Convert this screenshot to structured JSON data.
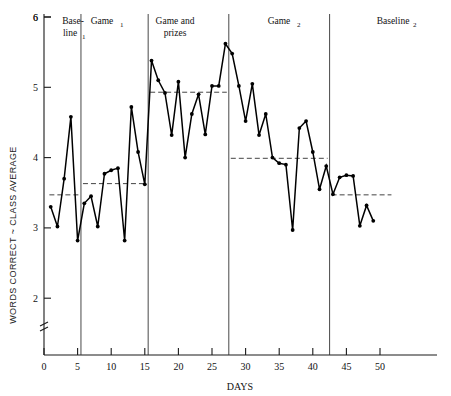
{
  "chart_data": {
    "type": "line",
    "title": "",
    "xlabel": "DAYS",
    "ylabel": "WORDS CORRECT ~ CLASS AVERAGE",
    "xlim": [
      0,
      52
    ],
    "ylim": [
      1.55,
      6
    ],
    "axis_break": true,
    "grid": false,
    "legend": "none",
    "xticks": [
      0,
      5,
      10,
      15,
      20,
      25,
      30,
      35,
      40,
      45,
      50
    ],
    "yticks": [
      2,
      3,
      4,
      5,
      6
    ],
    "series": [
      {
        "name": "Words correct minus class average",
        "x": [
          1,
          2,
          3,
          4,
          5,
          6,
          7,
          8,
          9,
          10,
          11,
          12,
          13,
          14,
          15,
          16,
          17,
          18,
          19,
          20,
          21,
          22,
          23,
          24,
          25,
          26,
          27,
          28,
          29,
          30,
          31,
          32,
          33,
          34,
          35,
          36,
          37,
          38,
          39,
          40,
          41,
          42,
          43,
          44,
          45,
          46,
          47,
          48,
          49
        ],
        "y": [
          3.3,
          3.02,
          3.7,
          4.58,
          2.82,
          3.35,
          3.45,
          3.02,
          3.77,
          3.82,
          3.85,
          2.82,
          4.72,
          4.08,
          3.62,
          5.38,
          5.1,
          4.92,
          4.32,
          5.08,
          4.0,
          4.62,
          4.9,
          4.33,
          5.02,
          5.02,
          5.62,
          5.48,
          5.02,
          4.52,
          5.05,
          4.32,
          4.62,
          4.0,
          3.92,
          3.9,
          2.97,
          4.42,
          4.52,
          4.08,
          3.55,
          3.88,
          3.48,
          3.72,
          3.75,
          3.74,
          3.03,
          3.32,
          3.1
        ]
      }
    ],
    "phases": [
      {
        "label": "Base-\nline",
        "sub": "1",
        "x_start": 0.5,
        "x_end": 5.5,
        "mean": 3.47
      },
      {
        "label": "Game",
        "sub": "1",
        "x_start": 5.5,
        "x_end": 15.5,
        "mean": 3.63
      },
      {
        "label": "Game and\nprizes",
        "sub": "",
        "x_start": 15.5,
        "x_end": 27.5,
        "mean": 4.93
      },
      {
        "label": "Game",
        "sub": "2",
        "x_start": 27.5,
        "x_end": 42.5,
        "mean": 3.99
      },
      {
        "label": "Baseline",
        "sub": "2",
        "x_start": 42.5,
        "x_end": 52,
        "mean": 3.47
      }
    ],
    "phase_dividers": [
      5.5,
      15.5,
      27.5,
      42.5
    ],
    "colors": {
      "line": "#000000",
      "mean": "#444444",
      "axis": "#1a1a1a",
      "divider": "#333333",
      "background": "#ffffff"
    }
  },
  "labels": {
    "y_axis": "WORDS CORRECT ~ CLASS AVERAGE",
    "x_axis": "DAYS",
    "phase_1_line1": "Base-",
    "phase_1_line2": "line",
    "phase_1_sub": "1",
    "phase_2_main": "Game",
    "phase_2_sub": "1",
    "phase_3_line1": "Game and",
    "phase_3_line2": "prizes",
    "phase_4_main": "Game",
    "phase_4_sub": "2",
    "phase_5_main": "Baseline",
    "phase_5_sub": "2",
    "ytick_6": "6",
    "ytick_5": "5",
    "ytick_4": "4",
    "ytick_3": "3",
    "ytick_2": "2",
    "xtick_0": "0",
    "xtick_5": "5",
    "xtick_10": "10",
    "xtick_15": "15",
    "xtick_20": "20",
    "xtick_25": "25",
    "xtick_30": "30",
    "xtick_35": "35",
    "xtick_40": "40",
    "xtick_45": "45",
    "xtick_50": "50"
  }
}
